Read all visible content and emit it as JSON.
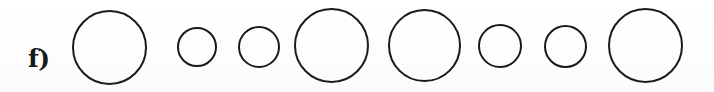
{
  "figure": {
    "label": "f)",
    "background_color": "#fdfdfd",
    "stroke_color": "#1a1a1a",
    "fill": "none",
    "stroke_width_px": 2,
    "width_px": 714,
    "height_px": 92
  },
  "chart_data": {
    "type": "scatter",
    "title": "f)",
    "xlabel": "",
    "ylabel": "",
    "grid": false,
    "legend": null,
    "xlim": [
      0,
      714
    ],
    "ylim": [
      0,
      92
    ],
    "series": [
      {
        "name": "circles",
        "marker": "open-circle",
        "points": [
          {
            "index": 1,
            "cx": 109.5,
            "cy": 47.5,
            "diameter": 75,
            "size_class": "large"
          },
          {
            "index": 2,
            "cx": 197.0,
            "cy": 47.0,
            "diameter": 40,
            "size_class": "small"
          },
          {
            "index": 3,
            "cx": 259.0,
            "cy": 46.5,
            "diameter": 42,
            "size_class": "small"
          },
          {
            "index": 4,
            "cx": 331.5,
            "cy": 45.5,
            "diameter": 75,
            "size_class": "large"
          },
          {
            "index": 5,
            "cx": 424.0,
            "cy": 45.5,
            "diameter": 73,
            "size_class": "large"
          },
          {
            "index": 6,
            "cx": 500.0,
            "cy": 45.5,
            "diameter": 44,
            "size_class": "small"
          },
          {
            "index": 7,
            "cx": 565.0,
            "cy": 46.0,
            "diameter": 43,
            "size_class": "small"
          },
          {
            "index": 8,
            "cx": 645.5,
            "cy": 45.5,
            "diameter": 75,
            "size_class": "large"
          }
        ]
      }
    ],
    "counts": {
      "total": 8,
      "large": 4,
      "small": 4
    }
  }
}
